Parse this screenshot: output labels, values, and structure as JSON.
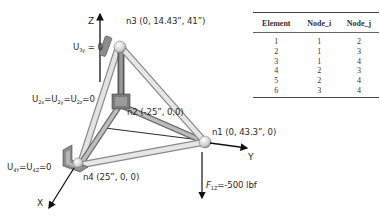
{
  "diagram": {
    "axes": {
      "x_label": "X",
      "y_label": "Y",
      "z_label": "Z"
    },
    "nodes": [
      {
        "id": "n1",
        "label": "n1 (0, 43.3”, 0)"
      },
      {
        "id": "n2",
        "label": "n2 (-25”, 0,0)"
      },
      {
        "id": "n3",
        "label": "n3 (0, 14.43”, 41”)"
      },
      {
        "id": "n4",
        "label": "n4 (25”, 0, 0)"
      }
    ],
    "constraints": {
      "n3": {
        "main": "U",
        "sub": "3y",
        "rest": " = 0"
      },
      "n2": {
        "parts": [
          "U",
          "2x",
          "=U",
          "2y",
          "=U",
          "2z",
          "=0"
        ]
      },
      "n4": {
        "parts": [
          "U",
          "4Y",
          "=U",
          "4Z",
          "=0"
        ]
      }
    },
    "force": {
      "main": "F",
      "sub": "1Z",
      "rest": "=-500 lbf"
    },
    "colors": {
      "member": "#d9d9d9",
      "member_edge": "#8a8a8a",
      "support": "#8c8c8c",
      "arrow": "#111111"
    }
  },
  "table": {
    "headers": [
      "Element",
      "Node_i",
      "Node_j"
    ],
    "rows": [
      [
        "1",
        "1",
        "2"
      ],
      [
        "2",
        "1",
        "3"
      ],
      [
        "3",
        "1",
        "4"
      ],
      [
        "4",
        "2",
        "3"
      ],
      [
        "5",
        "2",
        "4"
      ],
      [
        "6",
        "3",
        "4"
      ]
    ]
  }
}
